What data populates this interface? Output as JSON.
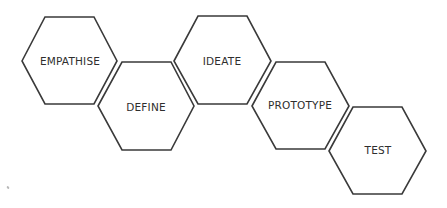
{
  "diagram": {
    "stroke_color": "#3a3a3a",
    "text_color": "#2e2e2e",
    "background": "#ffffff",
    "stages": [
      {
        "label": "EMPATHISE",
        "cx": 70,
        "cy": 61
      },
      {
        "label": "DEFINE",
        "cx": 146,
        "cy": 106
      },
      {
        "label": "IDEATE",
        "cx": 222,
        "cy": 61
      },
      {
        "label": "PROTOTYPE",
        "cx": 300,
        "cy": 106
      },
      {
        "label": "TEST",
        "cx": 378,
        "cy": 151
      }
    ]
  }
}
